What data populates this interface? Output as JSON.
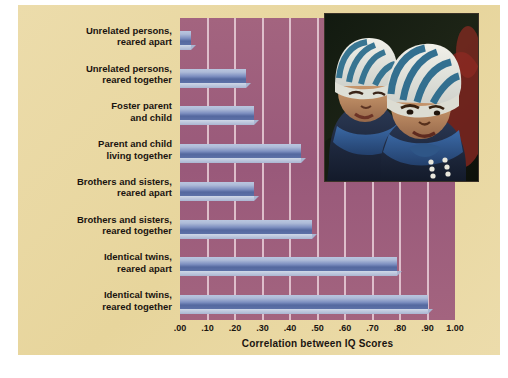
{
  "chart_data": {
    "type": "bar",
    "orientation": "horizontal",
    "title": "",
    "xlabel": "Correlation between IQ Scores",
    "ylabel": "",
    "xlim": [
      0.0,
      1.0
    ],
    "xticks": [
      ".00",
      ".10",
      ".20",
      ".30",
      ".40",
      ".50",
      ".60",
      ".70",
      ".80",
      ".90",
      "1.00"
    ],
    "xtick_values": [
      0.0,
      0.1,
      0.2,
      0.3,
      0.4,
      0.5,
      0.6,
      0.7,
      0.8,
      0.9,
      1.0
    ],
    "grid": "vertical-only",
    "legend": "none",
    "categories": [
      "Unrelated persons, reared apart",
      "Unrelated persons, reared together",
      "Foster parent and child",
      "Parent and child living together",
      "Brothers and sisters, reared apart",
      "Brothers and sisters, reared together",
      "Identical twins, reared apart",
      "Identical twins, reared together"
    ],
    "category_lines": [
      [
        "Unrelated persons,",
        "reared apart"
      ],
      [
        "Unrelated persons,",
        "reared together"
      ],
      [
        "Foster parent",
        "and child"
      ],
      [
        "Parent and child",
        "living together"
      ],
      [
        "Brothers and sisters,",
        "reared apart"
      ],
      [
        "Brothers and sisters,",
        "reared together"
      ],
      [
        "Identical twins,",
        "reared apart"
      ],
      [
        "Identical twins,",
        "reared together"
      ]
    ],
    "values": [
      0.04,
      0.24,
      0.27,
      0.44,
      0.27,
      0.48,
      0.79,
      0.9
    ],
    "colors": {
      "plot_background": "#9d5f7e",
      "panel_background": "#ead8a3",
      "gridline": "#e9cfd8",
      "bar_light": "#b9c6df",
      "bar_dark": "#54689f",
      "bar_bevel": "#cfd8e8",
      "text": "#1a1410",
      "page_background": "#ffffff"
    }
  },
  "photo": {
    "name": "twin-toddlers-photo",
    "caption": "",
    "description": "Two twin toddlers wearing blue-and-white striped knit caps and blue jackets"
  }
}
